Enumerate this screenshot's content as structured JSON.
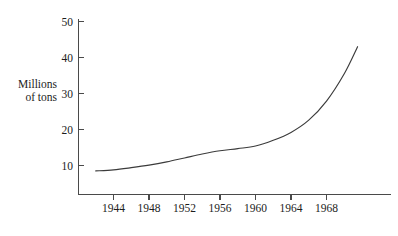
{
  "chart_data": {
    "type": "line",
    "title": "",
    "subtitle": "",
    "xlabel": "",
    "ylabel": "Millions of tons",
    "ylabel_lines": [
      "Millions",
      "of tons"
    ],
    "xlim": [
      1942,
      1972
    ],
    "ylim": [
      0,
      51
    ],
    "grid": false,
    "legend": "none",
    "y_ticks": [
      10,
      20,
      30,
      40,
      50
    ],
    "y_tick_labels": [
      "10",
      "20",
      "30",
      "40",
      "50"
    ],
    "x_ticks": [
      1944,
      1948,
      1952,
      1956,
      1960,
      1964,
      1968
    ],
    "x_tick_labels": [
      "1944",
      "1948",
      "1952",
      "1956",
      "1960",
      "1964",
      "1968"
    ],
    "x": [
      1942,
      1944,
      1946,
      1948,
      1950,
      1952,
      1954,
      1956,
      1958,
      1960,
      1962,
      1964,
      1966,
      1968,
      1970,
      1971.5
    ],
    "series": [
      {
        "name": "Millions of tons",
        "color": "#3b3b3b",
        "values": [
          8.5,
          8.8,
          9.4,
          10.1,
          11.0,
          12.1,
          13.2,
          14.1,
          14.7,
          15.4,
          17.0,
          19.2,
          22.6,
          27.9,
          35.5,
          43.0
        ]
      }
    ],
    "annotations": []
  },
  "axis": {
    "line_color": "#4a4a4a"
  }
}
